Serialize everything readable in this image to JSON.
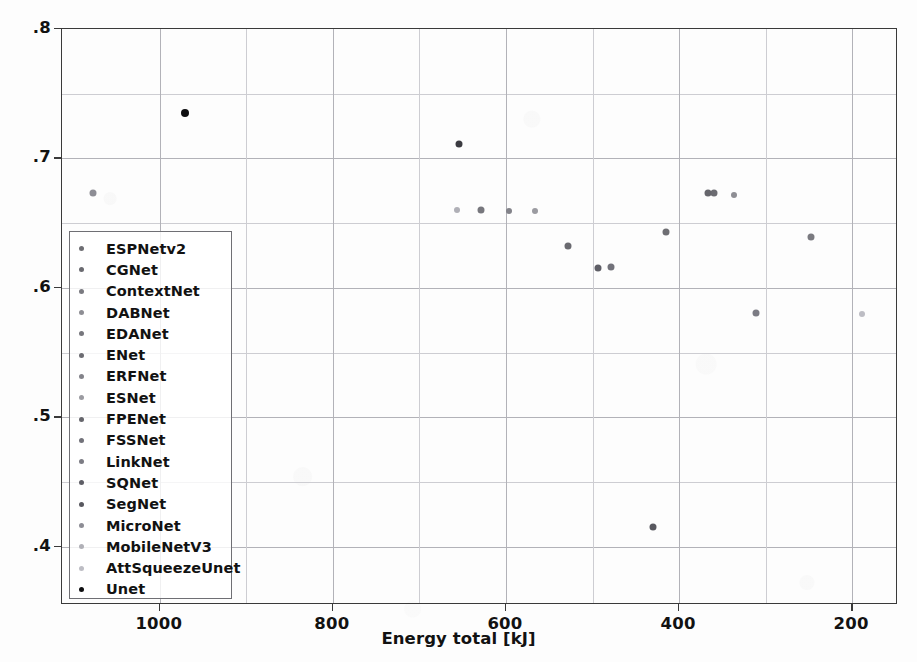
{
  "chart_data": {
    "type": "scatter",
    "title": "",
    "xlabel": "Energy total [kJ]",
    "ylabel": "Dice Score",
    "xlim": [
      1113,
      147
    ],
    "ylim": [
      0.355,
      0.8
    ],
    "x_reversed": true,
    "grid": true,
    "legend_position": "center-left",
    "xticks": [
      1000,
      800,
      600,
      400,
      200
    ],
    "xtick_labels": [
      "1000",
      "800",
      "600",
      "400",
      "200"
    ],
    "yticks": [
      0.8,
      0.7,
      0.6,
      0.5,
      0.4
    ],
    "ytick_labels": [
      ".8",
      ".7",
      ".6",
      ".5",
      ".4"
    ],
    "minor_gridlines_y": [
      0.75,
      0.65,
      0.55,
      0.45
    ],
    "minor_gridlines_x": [
      900,
      700,
      500,
      300
    ],
    "series": [
      {
        "name": "ESPNetv2",
        "color": "#6e6e73",
        "x": 415,
        "y": 0.6435,
        "marker_size": 7
      },
      {
        "name": "CGNet",
        "color": "#6a6a70",
        "x": 528,
        "y": 0.632,
        "marker_size": 7
      },
      {
        "name": "ContextNet",
        "color": "#7a7a80",
        "x": 247,
        "y": 0.639,
        "marker_size": 7
      },
      {
        "name": "DABNet",
        "color": "#8e8e94",
        "x": 337,
        "y": 0.6715,
        "marker_size": 6
      },
      {
        "name": "EDANet",
        "color": "#77777d",
        "x": 629,
        "y": 0.6605,
        "marker_size": 7
      },
      {
        "name": "ENet",
        "color": "#6c6c72",
        "x": 360,
        "y": 0.6735,
        "marker_size": 7
      },
      {
        "name": "ERFNet",
        "color": "#83838a",
        "x": 596,
        "y": 0.6595,
        "marker_size": 6
      },
      {
        "name": "ESNet",
        "color": "#9b9ba1",
        "x": 566,
        "y": 0.6595,
        "marker_size": 6
      },
      {
        "name": "FPENet",
        "color": "#66666c",
        "x": 366,
        "y": 0.673,
        "marker_size": 7
      },
      {
        "name": "FSSNet",
        "color": "#72727a",
        "x": 479,
        "y": 0.6165,
        "marker_size": 7
      },
      {
        "name": "LinkNet",
        "color": "#7c7c84",
        "x": 311,
        "y": 0.5805,
        "marker_size": 7
      },
      {
        "name": "SQNet",
        "color": "#5e5e66",
        "x": 494,
        "y": 0.615,
        "marker_size": 7
      },
      {
        "name": "SegNet",
        "color": "#58585f",
        "x": 430,
        "y": 0.415,
        "marker_size": 7
      },
      {
        "name": "MicroNet",
        "color": "#8d8d95",
        "x": 1077,
        "y": 0.673,
        "marker_size": 7
      },
      {
        "name": "MobileNetV3",
        "color": "#b0b0b7",
        "x": 656,
        "y": 0.6605,
        "marker_size": 6
      },
      {
        "name": "AttSqueezeUnet",
        "color": "#bdbdc4",
        "x": 189,
        "y": 0.58,
        "marker_size": 6
      },
      {
        "name": "Unet",
        "color": "#0e0e10",
        "x": 971,
        "y": 0.735,
        "marker_size": 8
      }
    ],
    "extra_points": [
      {
        "name": "unlabeled-dark-point",
        "color": "#3b3b41",
        "x": 654,
        "y": 0.711,
        "marker_size": 7
      }
    ]
  }
}
